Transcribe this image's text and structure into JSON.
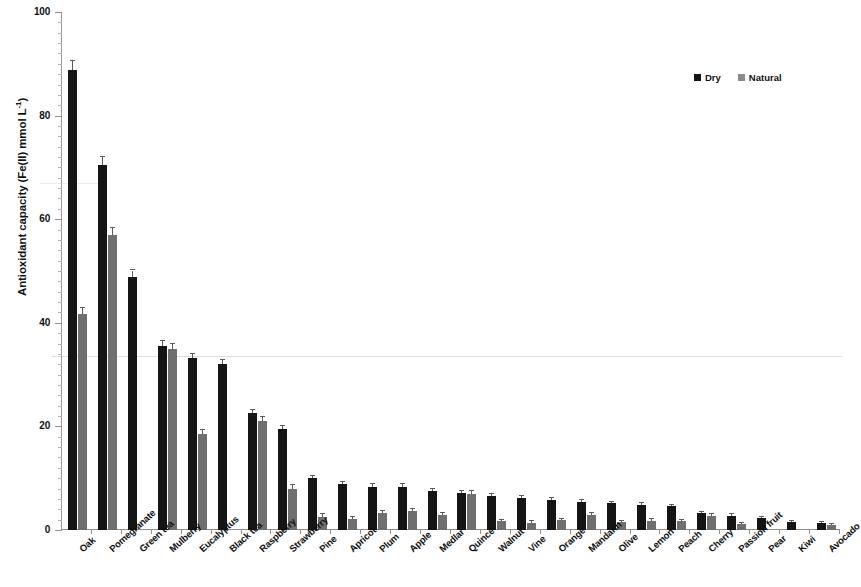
{
  "chart_data": {
    "type": "bar",
    "title": "",
    "xlabel": "",
    "ylabel": "Antioxidant capacity (Fe(II) mmol L-1)",
    "ylabel_html": "Antioxidant capacity (Fe(II) mmol L",
    "ylabel_sup": "-1",
    "ylabel_tail": ")",
    "ylim": [
      0,
      100
    ],
    "yticks": [
      0,
      20,
      40,
      60,
      80,
      100
    ],
    "ytick_labels": [
      "0",
      "20",
      "40",
      "60",
      "80",
      "100"
    ],
    "grid": false,
    "legend_position": "top-right",
    "categories": [
      "Oak",
      "Pomegranate",
      "Green tea",
      "Mulberry",
      "Eucalyptus",
      "Black tea",
      "Raspberry",
      "Strawberry",
      "Pine",
      "Apricot",
      "Plum",
      "Apple",
      "Medlar",
      "Quince",
      "Walnut",
      "Vine",
      "Orange",
      "Mandarin",
      "Olive",
      "Lemon",
      "Peach",
      "Cherry",
      "Passion fruit",
      "Pear",
      "Kiwi",
      "Avocado"
    ],
    "series": [
      {
        "name": "Dry",
        "color": "#151515",
        "values": [
          88.8,
          70.5,
          48.8,
          35.5,
          33.2,
          32.0,
          22.5,
          19.5,
          10.0,
          8.8,
          8.4,
          8.4,
          7.6,
          7.2,
          6.6,
          6.2,
          5.8,
          5.4,
          5.2,
          4.9,
          4.6,
          3.2,
          2.8,
          2.3,
          1.5,
          1.4
        ],
        "errors": [
          1.8,
          1.6,
          1.3,
          0.9,
          0.8,
          0.8,
          0.7,
          0.6,
          0.5,
          0.5,
          0.5,
          0.5,
          0.4,
          0.4,
          0.4,
          0.4,
          0.4,
          0.3,
          0.3,
          0.3,
          0.3,
          0.3,
          0.2,
          0.2,
          0.2,
          0.2
        ]
      },
      {
        "name": "Natural",
        "color": "#6f6f6f",
        "values": [
          41.7,
          57.0,
          0.0,
          35.0,
          18.5,
          0.0,
          21.0,
          8.0,
          2.6,
          2.2,
          3.2,
          3.6,
          2.9,
          7.0,
          1.7,
          1.4,
          1.9,
          2.9,
          1.5,
          1.8,
          1.7,
          2.7,
          1.1,
          0.0,
          0.0,
          1.0
        ],
        "errors": [
          1.2,
          1.3,
          0.0,
          1.0,
          0.9,
          0.0,
          0.8,
          0.6,
          0.4,
          0.3,
          0.4,
          0.4,
          0.3,
          0.5,
          0.3,
          0.3,
          0.3,
          0.3,
          0.2,
          0.3,
          0.3,
          0.3,
          0.2,
          0.0,
          0.0,
          0.2
        ]
      }
    ]
  },
  "legend": {
    "items": [
      {
        "label": "Dry",
        "swatch": "dry-swatch"
      },
      {
        "label": "Natural",
        "swatch": "natural-swatch"
      }
    ]
  }
}
